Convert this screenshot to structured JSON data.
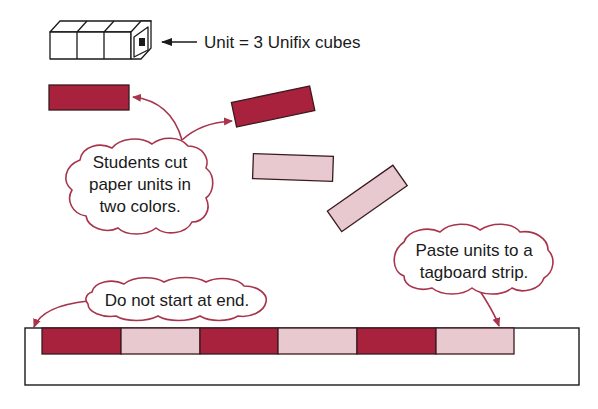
{
  "diagram": {
    "unit_label": "Unit = 3 Unifix cubes",
    "callouts": {
      "cut": [
        "Students cut",
        "paper units in",
        "two colors."
      ],
      "paste": [
        "Paste units to a",
        "tagboard strip."
      ],
      "start": "Do not start at end."
    },
    "colors": {
      "dark_unit": "#a8213d",
      "light_unit": "#e7c9cf",
      "callout_outline": "#a8344c",
      "text": "#1a1a1a"
    },
    "loose_units": [
      {
        "color": "dark",
        "rotation": 0
      },
      {
        "color": "dark",
        "rotation": -12
      },
      {
        "color": "light",
        "rotation": 3
      },
      {
        "color": "light",
        "rotation": -35
      }
    ],
    "strip_units": [
      "dark",
      "light",
      "dark",
      "light",
      "dark",
      "light"
    ]
  }
}
